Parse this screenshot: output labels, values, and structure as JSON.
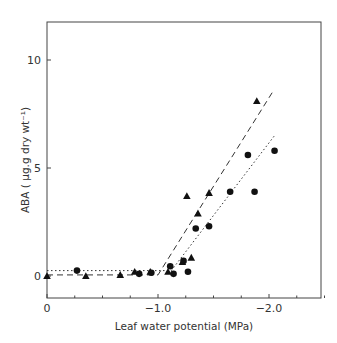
{
  "chart_data": {
    "type": "scatter",
    "title": "",
    "xlabel": "Leaf water potential (MPa)",
    "ylabel": "ABA ( µg.g dry wt⁻¹)",
    "xlim": [
      0,
      -2.5
    ],
    "ylim": [
      -1,
      11.8
    ],
    "x_ticks": [
      0,
      -1.0,
      -2.0
    ],
    "x_tick_labels": [
      "0",
      "−1.0",
      "−2.0"
    ],
    "x_minor_ticks": [
      -0.25,
      -0.5,
      -0.75,
      -1.25,
      -1.5,
      -1.75,
      -2.25,
      -2.5
    ],
    "y_ticks": [
      0,
      5,
      10
    ],
    "y_tick_labels": [
      "0",
      "5",
      "10"
    ],
    "grid": false,
    "legend": null,
    "series": [
      {
        "name": "triangles",
        "marker": "triangle",
        "points": [
          {
            "x": 0.0,
            "y": 0.0
          },
          {
            "x": -0.35,
            "y": 0.0
          },
          {
            "x": -0.66,
            "y": 0.05
          },
          {
            "x": -0.79,
            "y": 0.2
          },
          {
            "x": -0.93,
            "y": 0.2
          },
          {
            "x": -1.09,
            "y": 0.2
          },
          {
            "x": -1.22,
            "y": 0.65
          },
          {
            "x": -1.3,
            "y": 0.85
          },
          {
            "x": -1.26,
            "y": 3.7
          },
          {
            "x": -1.36,
            "y": 2.9
          },
          {
            "x": -1.46,
            "y": 3.85
          },
          {
            "x": -1.89,
            "y": 8.1
          }
        ],
        "fit_line": {
          "style": "dashed",
          "points": [
            {
              "x": 0,
              "y": 0.05
            },
            {
              "x": -1.0,
              "y": 0.05
            },
            {
              "x": -2.03,
              "y": 8.5
            }
          ]
        }
      },
      {
        "name": "circles",
        "marker": "circle",
        "points": [
          {
            "x": -0.27,
            "y": 0.25
          },
          {
            "x": -0.83,
            "y": 0.1
          },
          {
            "x": -0.94,
            "y": 0.15
          },
          {
            "x": -1.11,
            "y": 0.45
          },
          {
            "x": -1.14,
            "y": 0.1
          },
          {
            "x": -1.23,
            "y": 0.7
          },
          {
            "x": -1.27,
            "y": 0.2
          },
          {
            "x": -1.34,
            "y": 2.2
          },
          {
            "x": -1.46,
            "y": 2.3
          },
          {
            "x": -1.65,
            "y": 3.9
          },
          {
            "x": -1.87,
            "y": 3.9
          },
          {
            "x": -1.81,
            "y": 5.6
          },
          {
            "x": -2.05,
            "y": 5.8
          }
        ],
        "fit_line": {
          "style": "dotted",
          "points": [
            {
              "x": 0,
              "y": 0.25
            },
            {
              "x": -1.12,
              "y": 0.25
            },
            {
              "x": -2.05,
              "y": 6.5
            }
          ]
        }
      }
    ]
  }
}
